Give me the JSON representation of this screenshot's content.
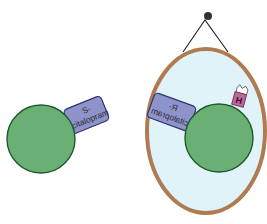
{
  "diagram": {
    "left_molecule": {
      "label_line1": "S-",
      "label_line2": "citalopram"
    },
    "mirror": {
      "reflected_label_line1": "R-",
      "reflected_label_line2": "citalopram",
      "tag": "H"
    },
    "colors": {
      "sphere": "#6aaf74",
      "sphere_stroke": "#1f5a2c",
      "tab": "#8e93c9",
      "tab_stroke": "#2f3470",
      "mirror_frame": "#b07a52",
      "mirror_glass": "#dff3f8",
      "tag": "#c0679a"
    }
  }
}
